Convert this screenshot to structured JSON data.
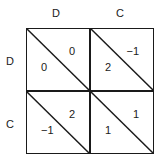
{
  "column_player_strategies": [
    "D",
    "C"
  ],
  "row_player_strategies": [
    "D",
    "C"
  ],
  "cells": [
    {
      "row": "D",
      "col": "D",
      "row_payoff": "0",
      "col_payoff": "0"
    },
    {
      "row": "D",
      "col": "C",
      "row_payoff": "2",
      "col_payoff": "−1"
    },
    {
      "row": "C",
      "col": "D",
      "row_payoff": "−1",
      "col_payoff": "2"
    },
    {
      "row": "C",
      "col": "C",
      "row_payoff": "1",
      "col_payoff": "1"
    }
  ]
}
